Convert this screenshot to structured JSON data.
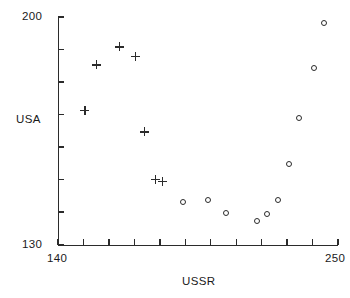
{
  "chart_data": {
    "type": "scatter",
    "title": "",
    "xlabel": "USSR",
    "ylabel": "USA",
    "xlim": [
      140,
      250
    ],
    "ylim": [
      130,
      200
    ],
    "xticks": [
      140,
      150,
      160,
      170,
      180,
      190,
      200,
      210,
      220,
      230,
      240,
      250
    ],
    "xtick_labels_shown": [
      "140",
      "250"
    ],
    "yticks": [
      130,
      140,
      150,
      160,
      170,
      180,
      190,
      200
    ],
    "ytick_labels_shown": [
      "130",
      "200"
    ],
    "grid": false,
    "legend": "none",
    "series": [
      {
        "name": "plus",
        "marker": "plus",
        "points": [
          {
            "x": 150.6,
            "y": 171.2
          },
          {
            "x": 155.0,
            "y": 185.3
          },
          {
            "x": 164.0,
            "y": 190.8
          },
          {
            "x": 170.4,
            "y": 188.0
          },
          {
            "x": 173.9,
            "y": 164.7
          },
          {
            "x": 178.2,
            "y": 150.0
          },
          {
            "x": 181.0,
            "y": 149.4
          }
        ]
      },
      {
        "name": "circle",
        "marker": "circle",
        "points": [
          {
            "x": 189.3,
            "y": 143.2
          },
          {
            "x": 199.1,
            "y": 143.8
          },
          {
            "x": 205.9,
            "y": 139.8
          },
          {
            "x": 218.1,
            "y": 137.4
          },
          {
            "x": 222.0,
            "y": 139.5
          },
          {
            "x": 226.3,
            "y": 143.8
          },
          {
            "x": 230.7,
            "y": 154.9
          },
          {
            "x": 234.6,
            "y": 169.0
          },
          {
            "x": 240.5,
            "y": 184.4
          },
          {
            "x": 244.5,
            "y": 198.2
          }
        ]
      }
    ]
  },
  "labels": {
    "y_axis_title": "USA",
    "x_axis_title": "USSR",
    "y_max": "200",
    "y_min": "130",
    "x_min": "140",
    "x_max": "250"
  },
  "colors": {
    "axis": "#2b2b2b",
    "marker": "#2b2b2b",
    "background": "#ffffff"
  }
}
